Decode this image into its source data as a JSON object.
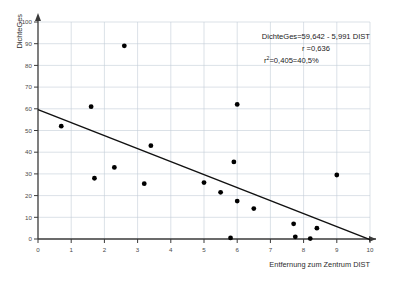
{
  "chart_data": {
    "type": "scatter",
    "title": "",
    "xlabel": "Entfernung zum Zentrum  DIST",
    "ylabel": "DichteGes",
    "xlim": [
      0,
      10
    ],
    "ylim": [
      0,
      100
    ],
    "xticks": [
      "0",
      "1",
      "2",
      "3",
      "4",
      "5",
      "6",
      "7",
      "8",
      "9",
      "10"
    ],
    "yticks": [
      "0",
      "10",
      "20",
      "30",
      "40",
      "50",
      "60",
      "70",
      "80",
      "90",
      "100"
    ],
    "grid": true,
    "legend": "none",
    "marker_color": "#000000",
    "grid_color": "#c3ccd6",
    "axis_color": "#3a3a3a",
    "line_color": "#111111",
    "points": [
      {
        "x": 0.7,
        "y": 52.0
      },
      {
        "x": 1.6,
        "y": 61.0
      },
      {
        "x": 1.7,
        "y": 28.0
      },
      {
        "x": 2.3,
        "y": 33.0
      },
      {
        "x": 2.6,
        "y": 89.0
      },
      {
        "x": 3.2,
        "y": 25.5
      },
      {
        "x": 3.4,
        "y": 43.0
      },
      {
        "x": 5.0,
        "y": 26.0
      },
      {
        "x": 5.5,
        "y": 21.5
      },
      {
        "x": 5.8,
        "y": 0.5
      },
      {
        "x": 5.9,
        "y": 35.5
      },
      {
        "x": 6.0,
        "y": 62.0
      },
      {
        "x": 6.0,
        "y": 17.5
      },
      {
        "x": 6.5,
        "y": 14.0
      },
      {
        "x": 7.7,
        "y": 7.0
      },
      {
        "x": 7.75,
        "y": 1.0
      },
      {
        "x": 8.2,
        "y": 0.2
      },
      {
        "x": 8.4,
        "y": 5.0
      },
      {
        "x": 9.0,
        "y": 29.5
      }
    ],
    "regression": {
      "intercept": 59.642,
      "slope": -5.991,
      "x_start": 0,
      "x_end": 10
    }
  },
  "annotation": {
    "equation": "DichteGes=59,642 - 5,991 DIST",
    "r_line": "r =0,636",
    "r2_symbol": "r",
    "r2_exponent": "2",
    "r2_value": "=0,405=40,5%"
  }
}
